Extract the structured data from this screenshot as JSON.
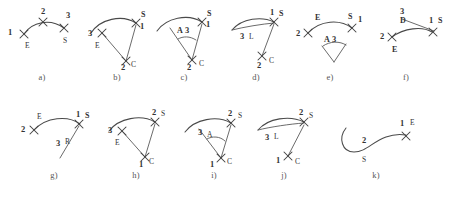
{
  "figure": {
    "title": "",
    "background_color": "#ffffff",
    "ink_color": "#4a4a4a",
    "panel_count": 11,
    "point_marker": "x-mark"
  },
  "captions": {
    "a": "a)",
    "b": "b)",
    "c": "c)",
    "d": "d)",
    "e": "e)",
    "f": "f)",
    "g": "g)",
    "h": "h)",
    "i": "i)",
    "j": "j)",
    "k": "k)"
  },
  "panels": {
    "a": {
      "caption": "a)",
      "labels": {
        "p1_num": "1",
        "p1_ltr": "E",
        "p2_num": "2",
        "p3_num": "3",
        "p3_ltr": "S"
      }
    },
    "b": {
      "caption": "b)",
      "labels": {
        "p1_num": "1",
        "p1_ltr": "S",
        "p2_num": "2",
        "p2_ltr": "C",
        "p3_num": "3",
        "p3_ltr": "E"
      }
    },
    "c": {
      "caption": "c)",
      "labels": {
        "p1_num": "1",
        "p1_ltr": "S",
        "p2_num": "2",
        "p2_ltr": "C",
        "p3_num": "3",
        "p3_ltr": "A"
      }
    },
    "d": {
      "caption": "d)",
      "labels": {
        "p1_num": "1",
        "p1_ltr": "S",
        "p2_num": "2",
        "p2_ltr": "C",
        "p3_num": "3",
        "p3_ltr": "L"
      }
    },
    "e": {
      "caption": "e)",
      "labels": {
        "p1_num": "1",
        "p1_ltr": "S",
        "p2_num": "2",
        "p2_ltr": "E",
        "p3_num": "3",
        "p3_ltr": "A"
      }
    },
    "f": {
      "caption": "f)",
      "labels": {
        "p1_num": "1",
        "p1_ltr": "S",
        "p2_num": "2",
        "p2_ltr": "E",
        "p3_num": "3",
        "p3_ltr": "D"
      }
    },
    "g": {
      "caption": "g)",
      "labels": {
        "p1_num": "1",
        "p1_ltr": "S",
        "p2_num": "2",
        "p2_ltr": "E",
        "p3_num": "3",
        "p3_ltr": "R"
      }
    },
    "h": {
      "caption": "h)",
      "labels": {
        "p1_num": "1",
        "p1_ltr": "C",
        "p2_num": "2",
        "p2_ltr": "S",
        "p3_num": "3",
        "p3_ltr": "E"
      }
    },
    "i": {
      "caption": "i)",
      "labels": {
        "p1_num": "1",
        "p1_ltr": "C",
        "p2_num": "2",
        "p2_ltr": "S",
        "p3_num": "3",
        "p3_ltr": "A"
      }
    },
    "j": {
      "caption": "j)",
      "labels": {
        "p1_num": "1",
        "p1_ltr": "C",
        "p2_num": "2",
        "p2_ltr": "S",
        "p3_num": "3",
        "p3_ltr": "L"
      }
    },
    "k": {
      "caption": "k)",
      "labels": {
        "p1_num": "1",
        "p1_ltr": "E",
        "p2_num": "2",
        "p2_ltr": "S"
      }
    }
  }
}
